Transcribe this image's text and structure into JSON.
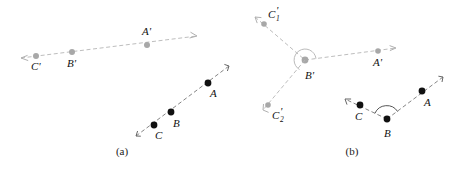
{
  "figure": {
    "background_color": "#ffffff",
    "solid_color": "#111111",
    "ghost_color": "#a8a8a8",
    "line_color": "#777777",
    "ghost_line_color": "#b6b6b6"
  },
  "panels": [
    {
      "id": "a",
      "caption": "(a)",
      "caption_pos": {
        "x": 122,
        "y": 155
      },
      "rays": [
        {
          "name": "image-ray-primed",
          "style": "ghost",
          "points": [
            {
              "label": "C'",
              "x": 36,
              "y": 56,
              "label_x": 31,
              "label_y": 70
            },
            {
              "label": "B'",
              "x": 72,
              "y": 52,
              "label_x": 67,
              "label_y": 67
            },
            {
              "label": "A'",
              "x": 147,
              "y": 45,
              "label_x": 142,
              "label_y": 35
            }
          ],
          "arrow_head": {
            "x": 197,
            "y": 36
          },
          "arrow_tail": {
            "x": 21,
            "y": 58
          }
        },
        {
          "name": "object-ray",
          "style": "solid",
          "points": [
            {
              "label": "C",
              "x": 154,
              "y": 125,
              "label_x": 155,
              "label_y": 139
            },
            {
              "label": "B",
              "x": 171,
              "y": 112,
              "label_x": 173,
              "label_y": 127
            },
            {
              "label": "A",
              "x": 208,
              "y": 83,
              "label_x": 210,
              "label_y": 97
            }
          ],
          "arrow_head": {
            "x": 229,
            "y": 66
          },
          "arrow_tail": {
            "x": 136,
            "y": 136
          }
        }
      ],
      "arcs": []
    },
    {
      "id": "b",
      "caption": "(b)",
      "caption_pos": {
        "x": 352,
        "y": 155
      },
      "rays": [
        {
          "name": "image-ray-primed-upper",
          "style": "ghost",
          "points": [
            {
              "label": "C₁'",
              "x": 264,
              "y": 24,
              "label_x": 270,
              "label_y": 19
            },
            {
              "label": "B'",
              "x": 305,
              "y": 60,
              "label_x": 307,
              "label_y": 78
            },
            {
              "label": "A'",
              "x": 378,
              "y": 51,
              "label_x": 376,
              "label_y": 65
            }
          ],
          "arrow_head": {
            "x": 396,
            "y": 48
          },
          "arrow_tail": {
            "x": 255,
            "y": 17
          }
        },
        {
          "name": "image-ray-primed-lower",
          "style": "ghost",
          "points": [
            {
              "label": "C₂'",
              "x": 268,
              "y": 105,
              "label_x": 274,
              "label_y": 119
            }
          ],
          "arrow_head": null,
          "arrow_tail": {
            "x": 263,
            "y": 110
          }
        },
        {
          "name": "object-ray-bent",
          "style": "solid",
          "points": [
            {
              "label": "C",
              "x": 360,
              "y": 105,
              "label_x": 356,
              "label_y": 120
            },
            {
              "label": "B",
              "x": 387,
              "y": 119,
              "label_x": 386,
              "label_y": 136
            },
            {
              "label": "A",
              "x": 422,
              "y": 91,
              "label_x": 424,
              "label_y": 106
            }
          ],
          "arrow_head": {
            "x": 345,
            "y": 99
          },
          "arrow_tail": {
            "x": 443,
            "y": 77
          }
        }
      ],
      "arcs": [
        {
          "name": "angle-arc-at-B-prime",
          "style": "ghost",
          "cx": 305,
          "cy": 60,
          "r": 11
        },
        {
          "name": "angle-arc-at-B",
          "style": "solid",
          "cx": 387,
          "cy": 119,
          "r": 13
        }
      ]
    }
  ],
  "labels": {
    "subscripts": {
      "one": "1",
      "two": "2"
    }
  }
}
